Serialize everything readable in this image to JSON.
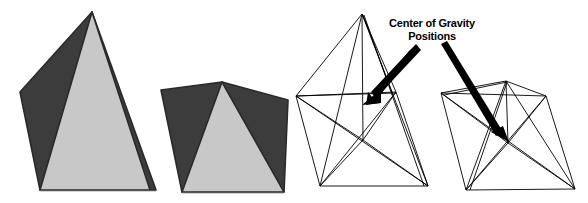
{
  "figure": {
    "background_color": "#ffffff",
    "annotation": {
      "line1": "Center of Gravity",
      "line2": "Positions",
      "color": "#000000"
    },
    "colors": {
      "shaded_face_dark": "#3c3c3c",
      "shaded_face_light": "#c8c8c8",
      "outline": "#1a1a1a",
      "wireframe_stroke": "#000000",
      "arrow_fill": "#000000"
    },
    "objects": [
      {
        "name": "solid-pyramid-upright",
        "kind": "solid",
        "orientation": "upright",
        "faces": [
          {
            "name": "left-face",
            "shade": "dark",
            "points": "92,12 20,92 40,190 96,190"
          },
          {
            "name": "right-face",
            "shade": "dark",
            "points": "92,12 156,190 119,190"
          },
          {
            "name": "front-face",
            "shade": "light",
            "points": "92,12 40,190 150,190"
          }
        ],
        "vertices": {
          "apex": [
            92,
            12
          ],
          "base_left": [
            20,
            92
          ],
          "base_front_left": [
            40,
            190
          ],
          "base_front_right": [
            150,
            190
          ],
          "base_right": [
            156,
            190
          ]
        }
      },
      {
        "name": "solid-pyramid-tilted",
        "kind": "solid",
        "orientation": "tilted",
        "faces": [
          {
            "name": "left-face",
            "shade": "dark",
            "points": "222,82 161,90 182,192 206,192"
          },
          {
            "name": "right-face",
            "shade": "dark",
            "points": "222,82 288,100 283,192 256,192"
          },
          {
            "name": "front-face",
            "shade": "light",
            "points": "222,82 182,192 283,192"
          }
        ],
        "vertices": {
          "apex": [
            222,
            82
          ],
          "base_left": [
            161,
            90
          ],
          "base_front_left": [
            182,
            192
          ],
          "base_front_right": [
            283,
            192
          ],
          "base_right": [
            288,
            100
          ]
        }
      },
      {
        "name": "wireframe-pyramid-upright",
        "kind": "wireframe",
        "orientation": "upright",
        "vertices": {
          "apex": [
            362,
            14
          ],
          "base_left": [
            296,
            96
          ],
          "base_back": [
            396,
            92
          ],
          "base_front_left": [
            320,
            186
          ],
          "base_front_right": [
            428,
            186
          ],
          "centroid": [
            369,
            104
          ]
        },
        "center_of_gravity": [
          369,
          104
        ]
      },
      {
        "name": "wireframe-pyramid-tilted",
        "kind": "wireframe",
        "orientation": "tilted",
        "vertices": {
          "apex": [
            506,
            81
          ],
          "base_left": [
            441,
            93
          ],
          "base_back": [
            546,
            96
          ],
          "base_front_left": [
            466,
            190
          ],
          "base_front_right": [
            575,
            189
          ],
          "centroid": [
            508,
            143
          ]
        },
        "center_of_gravity": [
          508,
          143
        ]
      }
    ],
    "arrows": [
      {
        "name": "arrow-to-left-cog",
        "from": [
          414,
          46
        ],
        "to": [
          362,
          104
        ],
        "target": "wireframe-pyramid-upright"
      },
      {
        "name": "arrow-to-right-cog",
        "from": [
          440,
          46
        ],
        "to": [
          506,
          139
        ],
        "target": "wireframe-pyramid-tilted"
      }
    ]
  }
}
